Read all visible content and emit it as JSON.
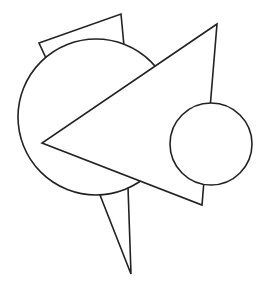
{
  "figure": {
    "type": "geometric-line-drawing",
    "background": "#ffffff",
    "stroke_color": "#222222",
    "shapes": [
      {
        "name": "upper-quadrilateral",
        "kind": "polygon",
        "points": [
          [
            39,
            43
          ],
          [
            121,
            14
          ],
          [
            124,
            46
          ],
          [
            46,
            58
          ]
        ]
      },
      {
        "name": "large-circle",
        "kind": "circle",
        "cx": 96,
        "cy": 117,
        "r": 78
      },
      {
        "name": "lower-spike",
        "kind": "polygon",
        "points": [
          [
            100,
            195
          ],
          [
            128,
            187
          ],
          [
            131,
            274
          ]
        ]
      },
      {
        "name": "large-triangle",
        "kind": "polygon",
        "points": [
          [
            217,
            24
          ],
          [
            42,
            143
          ],
          [
            202,
            205
          ]
        ]
      },
      {
        "name": "small-circle",
        "kind": "circle",
        "cx": 211,
        "cy": 144,
        "r": 41
      }
    ]
  }
}
